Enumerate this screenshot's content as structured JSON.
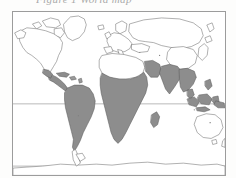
{
  "document": {
    "type": "scanned-world-map-figure",
    "caption_text": "Figure 1  World map",
    "caption_visible": "partially cut off at top edge"
  },
  "map": {
    "title": "World map",
    "projection": "Mercator",
    "frame": {
      "x": 12,
      "y": 11,
      "width": 214,
      "height": 165,
      "border_color": "#9c9c9c"
    },
    "background_color": "#ffffff",
    "land_outline_color": "#6e6e6e",
    "shaded_region_color": "#8d8d8d",
    "gridline_color": "#9a9a9a",
    "gridlines": [
      {
        "name": "equator",
        "label": "Equator",
        "y_px": 104
      },
      {
        "name": "southern-boundary",
        "label": "Southern latitude boundary",
        "y_px": 167
      }
    ],
    "legend_note": "Shaded areas denote tropical / highlighted regions",
    "shaded_regions": [
      "Central America",
      "Caribbean",
      "South America",
      "Sub-Saharan Africa",
      "Madagascar",
      "Arabian Peninsula coast",
      "Indian subcontinent",
      "Southeast Asia",
      "Indonesia",
      "New Guinea"
    ],
    "unshaded_regions": [
      "North America",
      "Greenland",
      "Europe",
      "North Africa",
      "Northern Asia",
      "China",
      "Japan",
      "Australia",
      "New Zealand",
      "Antarctica"
    ]
  },
  "colors": {
    "paper": "#fdfdfc",
    "frame": "#9c9c9c",
    "outline": "#6e6e6e",
    "shade": "#8d8d8d",
    "gridline": "#9a9a9a",
    "caption": "#8e8e8e"
  }
}
